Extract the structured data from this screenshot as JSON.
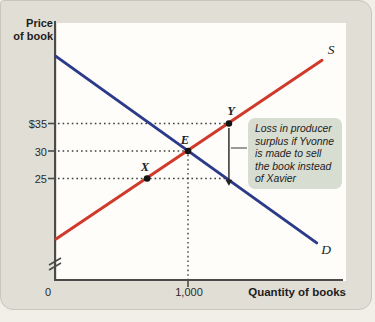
{
  "figure": {
    "y_axis_title": [
      "Price",
      "of book"
    ],
    "x_axis_title": "Quantity of books",
    "origin_label": "0"
  },
  "callout": {
    "lines": [
      "Loss in producer",
      "surplus if Yvonne",
      "is made to sell",
      "the book instead",
      "of Xavier"
    ]
  },
  "colors": {
    "page_bg": "#f1efe8",
    "card_bg": "#e1ded6",
    "plot_bg": "#fefdfa",
    "axis": "#4a4a4a",
    "supply": "#d03a2b",
    "demand": "#2c3a8a",
    "dotted": "#3f3f3f",
    "callout_bg": "#d8ddd1",
    "ink": "#1d1d1d"
  },
  "chart_data": {
    "type": "line",
    "xlabel": "Quantity of books",
    "ylabel": "Price of book",
    "x_axis_has_break": false,
    "y_axis_has_break": true,
    "grid": false,
    "x_ticks": [
      {
        "q": 1000,
        "label": "1,000"
      }
    ],
    "y_ticks": [
      {
        "p": 35,
        "label": "$35"
      },
      {
        "p": 30,
        "label": "30"
      },
      {
        "p": 25,
        "label": "25"
      }
    ],
    "series": [
      {
        "name": "supply",
        "label": "S",
        "color": "#d03a2b",
        "points": [
          [
            0,
            14
          ],
          [
            2015,
            46.5
          ]
        ]
      },
      {
        "name": "demand",
        "label": "D",
        "color": "#2c3a8a",
        "points": [
          [
            0,
            47.2
          ],
          [
            1975,
            13.3
          ]
        ]
      }
    ],
    "marked_points": [
      {
        "label": "X",
        "q": 690,
        "p": 25
      },
      {
        "label": "E",
        "q": 1000,
        "p": 30
      },
      {
        "label": "Y",
        "q": 1310,
        "p": 35
      }
    ],
    "guides": {
      "h": [
        {
          "p": 35,
          "to_q": 1285
        },
        {
          "p": 30,
          "to_q": 975
        },
        {
          "p": 25,
          "to_q": 1285
        }
      ],
      "v": [
        {
          "q": 1000,
          "from_p": 29.35
        }
      ]
    },
    "arrow": {
      "q": 1310,
      "from_p": 34.2,
      "to_p": 24.6
    },
    "annotation": "Loss in producer surplus if Yvonne is made to sell the book instead of Xavier"
  }
}
